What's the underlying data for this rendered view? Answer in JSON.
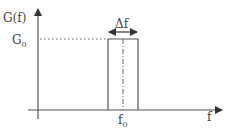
{
  "diagram": {
    "y_axis_label": "G(f)",
    "x_axis_label": "f",
    "level_label_main": "G",
    "level_label_sub": "0",
    "center_label_main": "f",
    "center_label_sub": "0",
    "bandwidth_label": "Δf",
    "colors": {
      "line": "#555555",
      "text": "#444444",
      "background": "#ffffff"
    }
  }
}
